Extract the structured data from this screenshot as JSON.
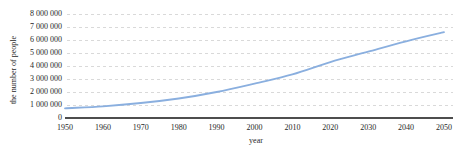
{
  "chart": {
    "y_axis_title": "the number of people",
    "x_axis_title": "year",
    "colors": {
      "line": "#8aafdf",
      "gridline": "#d9d9d9",
      "axis": "#4d4d4d",
      "text": "#1f1f1f",
      "background": "#ffffff"
    }
  },
  "chart_data": {
    "type": "line",
    "title": "",
    "xlabel": "year",
    "ylabel": "the number of people",
    "x": [
      1950,
      1960,
      1970,
      1980,
      1990,
      2000,
      2010,
      2020,
      2030,
      2040,
      2050
    ],
    "values": [
      750000,
      900000,
      1150000,
      1500000,
      2000000,
      2650000,
      3350000,
      4300000,
      5100000,
      5900000,
      6600000
    ],
    "xlim": [
      1950,
      2050
    ],
    "ylim": [
      0,
      8000000
    ],
    "y_tick_step": 1000000,
    "y_tick_labels": [
      "0",
      "1 000 000",
      "2 000 000",
      "3 000 000",
      "4 000 000",
      "5 000 000",
      "6 000 000",
      "7 000 000",
      "8 000 000"
    ],
    "x_tick_labels": [
      "1950",
      "1960",
      "1970",
      "1980",
      "1990",
      "2000",
      "2010",
      "2020",
      "2030",
      "2040",
      "2050"
    ],
    "grid": "horizontal-dashed",
    "legend": "none",
    "line_smooth": true
  }
}
